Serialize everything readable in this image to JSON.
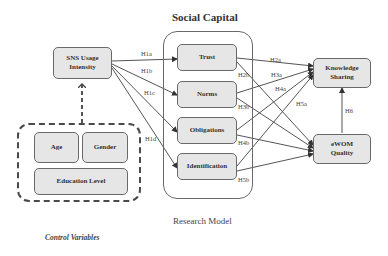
{
  "diagram": {
    "title": "Social Capital",
    "caption": "Research Model",
    "control_caption": "Control Variables",
    "nodes": {
      "sns": {
        "line1": "SNS Usage",
        "line2": "Intensity"
      },
      "trust": {
        "label": "Trust"
      },
      "norms": {
        "label": "Norms"
      },
      "obligations": {
        "label": "Obligations"
      },
      "identification": {
        "label": "Identification"
      },
      "knowledge": {
        "line1": "Knowledge",
        "line2": "Sharing"
      },
      "ewom": {
        "line1": "eWOM",
        "line2": "Quality"
      },
      "age": {
        "label": "Age"
      },
      "gender": {
        "label": "Gender"
      },
      "education": {
        "label": "Education Level"
      }
    },
    "hypotheses": {
      "h1a": "H1a",
      "h1b": "H1b",
      "h1c": "H1c",
      "h1d": "H1d",
      "h2a": "H2a",
      "h2b": "H2b",
      "h3a": "H3a",
      "h3b": "H3b",
      "h4a": "H4a",
      "h4b": "H4b",
      "h5a": "H5a",
      "h5b": "H5b",
      "h6": "H6"
    },
    "edges": [
      {
        "from": "SNS Usage Intensity",
        "to": "Trust",
        "label": "H1a"
      },
      {
        "from": "SNS Usage Intensity",
        "to": "Norms",
        "label": "H1b"
      },
      {
        "from": "SNS Usage Intensity",
        "to": "Obligations",
        "label": "H1c"
      },
      {
        "from": "SNS Usage Intensity",
        "to": "Identification",
        "label": "H1d"
      },
      {
        "from": "Trust",
        "to": "Knowledge Sharing",
        "label": "H2a"
      },
      {
        "from": "Trust",
        "to": "eWOM Quality",
        "label": "H2b"
      },
      {
        "from": "Norms",
        "to": "Knowledge Sharing",
        "label": "H3a"
      },
      {
        "from": "Norms",
        "to": "eWOM Quality",
        "label": "H3b"
      },
      {
        "from": "Obligations",
        "to": "Knowledge Sharing",
        "label": "H4a"
      },
      {
        "from": "Obligations",
        "to": "eWOM Quality",
        "label": "H4b"
      },
      {
        "from": "Identification",
        "to": "Knowledge Sharing",
        "label": "H5a"
      },
      {
        "from": "Identification",
        "to": "eWOM Quality",
        "label": "H5b"
      },
      {
        "from": "eWOM Quality",
        "to": "Knowledge Sharing",
        "label": "H6"
      },
      {
        "from": "Control Variables",
        "to": "SNS Usage Intensity",
        "label": "",
        "style": "dashed"
      }
    ],
    "colors": {
      "node_fill": "#e6e6e6",
      "stroke": "#6a6a6a",
      "text": "#333333"
    }
  }
}
